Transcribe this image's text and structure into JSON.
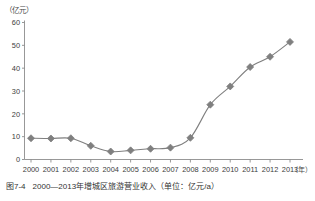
{
  "chart_data": {
    "type": "line",
    "title": "2000—2013年增城区旅游营业收入",
    "xlabel": "（年）",
    "ylabel": "（亿元）",
    "categories": [
      "2000",
      "2001",
      "2002",
      "2003",
      "2004",
      "2005",
      "2006",
      "2007",
      "2008",
      "2009",
      "2010",
      "2011",
      "2012",
      "2013"
    ],
    "values": [
      9.3,
      9.2,
      9.3,
      6.0,
      3.5,
      4.0,
      4.7,
      5.2,
      9.5,
      24.0,
      32.0,
      40.5,
      45.0,
      51.5
    ],
    "series": [
      {
        "name": "增城区旅游营业收入",
        "values": [
          9.3,
          9.2,
          9.3,
          6.0,
          3.5,
          4.0,
          4.7,
          5.2,
          9.5,
          24.0,
          32.0,
          40.5,
          45.0,
          51.5
        ]
      }
    ],
    "ylim": [
      0,
      60
    ],
    "yticks": [
      0,
      10,
      20,
      30,
      40,
      50,
      60
    ],
    "ytick_labels": [
      "0",
      "10",
      "20",
      "30",
      "40",
      "50",
      "60"
    ],
    "xtick_labels": [
      "2000",
      "2001",
      "2002",
      "2003",
      "2004",
      "2005",
      "2006",
      "2007",
      "2008",
      "2009",
      "2010",
      "2011",
      "2012",
      "2013"
    ],
    "grid": false,
    "legend": "none",
    "marker": "diamond",
    "series_color": "#7f7f7f",
    "axis_color": "#8c8c8c",
    "unit_note": "亿元/a"
  },
  "figure": {
    "caption_number": "图7-4",
    "caption_text": "2000—2013年增城区旅游营业收入（单位：亿元/a）"
  },
  "axes": {
    "y_unit": "（亿元）",
    "x_unit": "（年）"
  }
}
